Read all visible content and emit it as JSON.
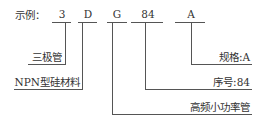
{
  "example_label": "示例：",
  "code_parts": [
    {
      "char": "3"
    },
    {
      "char": "D"
    },
    {
      "char": "G"
    },
    {
      "char": "84"
    },
    {
      "char": "A"
    }
  ],
  "meanings": {
    "triode": "三极管",
    "material": "NPN型硅材料",
    "spec": "规格:A",
    "serial": "序号:84",
    "type": "高频小功率管"
  }
}
